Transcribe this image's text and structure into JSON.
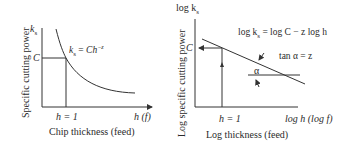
{
  "left_diagram": {
    "y_axis_label": "Specific cutting power",
    "y_axis_symbol": "k",
    "y_axis_symbol_sub": "s",
    "x_axis_symbol": "h (f)",
    "x_axis_label": "Chip thickness (feed)",
    "c_label": "C",
    "h1_label": "h = 1",
    "equation": {
      "lhs": "k",
      "sub": "s",
      "rhs": " = Ch",
      "exp": "−z"
    }
  },
  "right_diagram": {
    "y_axis_label": "Log specific cutting power",
    "y_axis_symbol": "log k",
    "y_axis_symbol_sub": "s",
    "x_axis_symbol": "log h (log f)",
    "x_axis_label": "Log thickness (feed)",
    "c_label": "C",
    "h1_label": "h = 1",
    "equation": "log k",
    "equation_sub": "s",
    "equation_rest": " = log C − z log h",
    "tan_label": "tan α = z",
    "alpha_label": "α"
  },
  "colors": {
    "line": "#333333",
    "text": "#2a2a2a"
  }
}
